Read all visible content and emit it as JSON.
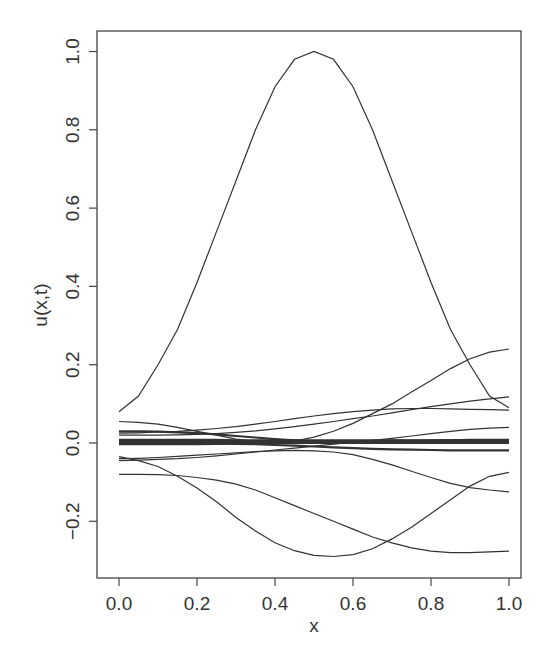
{
  "chart_data": {
    "type": "line",
    "title": "",
    "xlabel": "x",
    "ylabel": "u(x,t)",
    "xlim": [
      0.0,
      1.0
    ],
    "ylim": [
      -0.33,
      1.05
    ],
    "grid": false,
    "legend": null,
    "x_ticks": [
      "0.0",
      "0.2",
      "0.4",
      "0.6",
      "0.8",
      "1.0"
    ],
    "y_ticks": [
      "-0.2",
      "0.0",
      "0.2",
      "0.4",
      "0.6",
      "0.8",
      "1.0"
    ],
    "x": [
      0.0,
      0.05,
      0.1,
      0.15,
      0.2,
      0.25,
      0.3,
      0.35,
      0.4,
      0.45,
      0.5,
      0.55,
      0.6,
      0.65,
      0.7,
      0.75,
      0.8,
      0.85,
      0.9,
      0.95,
      1.0
    ],
    "series": [
      {
        "name": "t0",
        "values": [
          0.08,
          0.12,
          0.2,
          0.29,
          0.41,
          0.54,
          0.67,
          0.8,
          0.91,
          0.98,
          1.0,
          0.98,
          0.91,
          0.8,
          0.67,
          0.54,
          0.41,
          0.29,
          0.2,
          0.12,
          0.09
        ]
      },
      {
        "name": "t1",
        "values": [
          0.055,
          0.053,
          0.048,
          0.04,
          0.03,
          0.02,
          0.01,
          0.004,
          0.002,
          0.005,
          0.015,
          0.03,
          0.05,
          0.075,
          0.1,
          0.13,
          0.16,
          0.19,
          0.215,
          0.232,
          0.24
        ]
      },
      {
        "name": "t2",
        "values": [
          -0.035,
          -0.045,
          -0.06,
          -0.085,
          -0.115,
          -0.15,
          -0.19,
          -0.225,
          -0.255,
          -0.275,
          -0.287,
          -0.29,
          -0.285,
          -0.27,
          -0.245,
          -0.215,
          -0.18,
          -0.145,
          -0.11,
          -0.085,
          -0.075
        ]
      },
      {
        "name": "t3",
        "values": [
          -0.08,
          -0.08,
          -0.081,
          -0.083,
          -0.088,
          -0.095,
          -0.105,
          -0.12,
          -0.14,
          -0.16,
          -0.18,
          -0.2,
          -0.22,
          -0.24,
          -0.255,
          -0.268,
          -0.276,
          -0.28,
          -0.28,
          -0.278,
          -0.276
        ]
      },
      {
        "name": "t4",
        "values": [
          -0.04,
          -0.039,
          -0.037,
          -0.034,
          -0.031,
          -0.028,
          -0.025,
          -0.022,
          -0.02,
          -0.019,
          -0.02,
          -0.023,
          -0.03,
          -0.042,
          -0.056,
          -0.072,
          -0.088,
          -0.103,
          -0.114,
          -0.12,
          -0.125
        ]
      },
      {
        "name": "t5",
        "values": [
          -0.045,
          -0.044,
          -0.042,
          -0.04,
          -0.037,
          -0.033,
          -0.028,
          -0.023,
          -0.018,
          -0.013,
          -0.008,
          -0.003,
          0.002,
          0.007,
          0.012,
          0.018,
          0.024,
          0.03,
          0.035,
          0.038,
          0.04
        ]
      },
      {
        "name": "t6",
        "values": [
          0.025,
          0.026,
          0.028,
          0.03,
          0.033,
          0.037,
          0.042,
          0.048,
          0.055,
          0.062,
          0.069,
          0.075,
          0.08,
          0.084,
          0.087,
          0.088,
          0.088,
          0.087,
          0.086,
          0.085,
          0.084
        ]
      },
      {
        "name": "t7",
        "values": [
          0.02,
          0.02,
          0.02,
          0.021,
          0.022,
          0.024,
          0.027,
          0.031,
          0.036,
          0.042,
          0.048,
          0.055,
          0.062,
          0.069,
          0.077,
          0.085,
          0.093,
          0.1,
          0.107,
          0.113,
          0.118
        ]
      },
      {
        "name": "t8",
        "values": [
          0.03,
          0.03,
          0.029,
          0.027,
          0.025,
          0.022,
          0.018,
          0.014,
          0.01,
          0.007,
          0.004,
          0.002,
          0.0,
          0.0,
          0.002,
          0.004,
          0.006,
          0.007,
          0.008,
          0.008,
          0.008
        ]
      },
      {
        "name": "t9",
        "values": [
          0.0,
          0.0,
          0.0,
          0.0,
          0.0,
          -0.001,
          -0.002,
          -0.003,
          -0.005,
          -0.007,
          -0.009,
          -0.011,
          -0.013,
          -0.015,
          -0.016,
          -0.017,
          -0.018,
          -0.019,
          -0.019,
          -0.019,
          -0.019
        ]
      },
      {
        "name": "t10",
        "values": [
          0.008,
          0.008,
          0.008,
          0.008,
          0.008,
          0.008,
          0.007,
          0.007,
          0.007,
          0.007,
          0.007,
          0.007,
          0.007,
          0.007,
          0.007,
          0.007,
          0.007,
          0.007,
          0.007,
          0.007,
          0.007
        ]
      },
      {
        "name": "t11",
        "values": [
          0.003,
          0.003,
          0.003,
          0.003,
          0.003,
          0.003,
          0.003,
          0.003,
          0.003,
          0.003,
          0.003,
          0.003,
          0.003,
          0.003,
          0.003,
          0.003,
          0.003,
          0.003,
          0.003,
          0.003,
          0.003
        ]
      },
      {
        "name": "t12",
        "values": [
          -0.003,
          -0.003,
          -0.003,
          -0.003,
          -0.003,
          -0.002,
          -0.001,
          0.0,
          0.001,
          0.002,
          0.003,
          0.004,
          0.005,
          0.005,
          0.006,
          0.006,
          0.006,
          0.007,
          0.007,
          0.007,
          0.007
        ]
      },
      {
        "name": "t13",
        "values": [
          0.0,
          0.0,
          0.0,
          0.0,
          0.0,
          0.0,
          0.0,
          0.0,
          0.0,
          0.0,
          0.0,
          0.0,
          0.0,
          0.0,
          0.0,
          0.0,
          0.0,
          0.0,
          0.0,
          0.0,
          0.0
        ]
      }
    ],
    "line_color": "#333333"
  }
}
